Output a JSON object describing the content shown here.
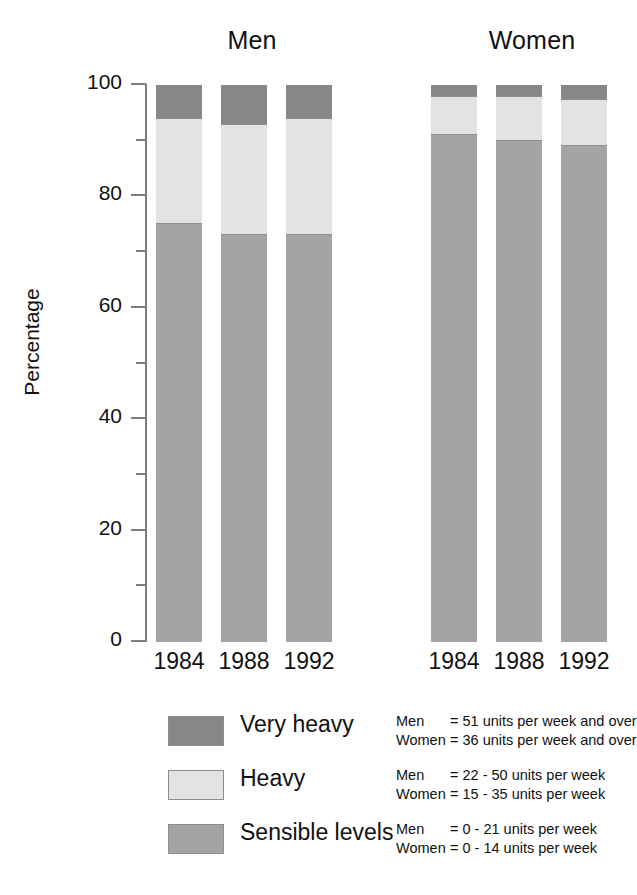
{
  "chart_data": {
    "type": "bar",
    "subtype": "stacked-bar",
    "title": "",
    "xlabel": "",
    "ylabel": "Percentage",
    "ylim": [
      0,
      100
    ],
    "yticks": [
      0,
      20,
      40,
      60,
      80,
      100
    ],
    "ytick_labels": [
      "0",
      "20",
      "40",
      "60",
      "80",
      "100"
    ],
    "minor_yticks": [
      10,
      30,
      50,
      70,
      90
    ],
    "grid": false,
    "legend_position": "below-plot",
    "stack_order_bottom_to_top": [
      "Sensible levels",
      "Heavy",
      "Very heavy"
    ],
    "groups": [
      "Men",
      "Women"
    ],
    "categories": [
      "1984",
      "1988",
      "1992"
    ],
    "series": [
      {
        "name": "Sensible levels",
        "color": "#a4a4a4",
        "values": {
          "Men": [
            75,
            73,
            73
          ],
          "Women": [
            91,
            90,
            89
          ]
        }
      },
      {
        "name": "Heavy",
        "color": "#e3e3e3",
        "values": {
          "Men": [
            19,
            20,
            21
          ],
          "Women": [
            7,
            8,
            8.5
          ]
        }
      },
      {
        "name": "Very heavy",
        "color": "#888888",
        "values": {
          "Men": [
            6,
            7,
            6
          ],
          "Women": [
            2,
            2,
            2.5
          ]
        }
      }
    ]
  },
  "axis": {
    "y_label": "Percentage",
    "y_tick_labels": [
      "100",
      "80",
      "60",
      "40",
      "20",
      "0"
    ]
  },
  "groups": [
    {
      "title": "Men",
      "years": [
        "1984",
        "1988",
        "1992"
      ]
    },
    {
      "title": "Women",
      "years": [
        "1984",
        "1988",
        "1992"
      ]
    }
  ],
  "legend": {
    "items": [
      {
        "name": "Very heavy",
        "color": "#888888",
        "detail": [
          {
            "who": "Men",
            "text": "= 51 units per week and over"
          },
          {
            "who": "Women",
            "text": "= 36 units per week and over"
          }
        ]
      },
      {
        "name": "Heavy",
        "color": "#e3e3e3",
        "detail": [
          {
            "who": "Men",
            "text": "= 22 - 50 units per week"
          },
          {
            "who": "Women",
            "text": "= 15 - 35 units per week"
          }
        ]
      },
      {
        "name": "Sensible levels",
        "color": "#a4a4a4",
        "detail": [
          {
            "who": "Men",
            "text": "= 0 - 21 units per week"
          },
          {
            "who": "Women",
            "text": "= 0 - 14 units per week"
          }
        ]
      }
    ]
  },
  "colors": {
    "very_heavy": "#888888",
    "heavy": "#e3e3e3",
    "sensible": "#a4a4a4",
    "axis": "#7d7d7d",
    "text": "#111111",
    "background": "#ffffff"
  }
}
